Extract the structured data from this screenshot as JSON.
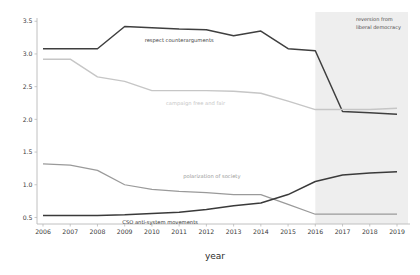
{
  "chart_data": {
    "type": "line",
    "title": "",
    "xlabel": "year",
    "ylabel": "",
    "categories": [
      2006,
      2007,
      2008,
      2009,
      2010,
      2011,
      2012,
      2013,
      2014,
      2015,
      2016,
      2017,
      2018,
      2019
    ],
    "xlim": [
      2006,
      2019
    ],
    "ylim": [
      0.4,
      3.55
    ],
    "grid": false,
    "legend_position": "inline-labels",
    "yticks": [
      "0.5",
      "1.0",
      "1.5",
      "2.0",
      "2.5",
      "3.0",
      "3.5"
    ],
    "ytick_values": [
      0.5,
      1.0,
      1.5,
      2.0,
      2.5,
      3.0,
      3.5
    ],
    "xticks": [
      "2006",
      "2007",
      "2008",
      "2009",
      "2010",
      "2011",
      "2012",
      "2013",
      "2014",
      "2015",
      "2016",
      "2017",
      "2018",
      "2019"
    ],
    "series": [
      {
        "name": "respect counterarguments",
        "color": "#3f3f3f",
        "width": 1.5,
        "label_x": 2011.0,
        "label_y": 3.18,
        "values": [
          3.08,
          3.08,
          3.08,
          3.42,
          3.4,
          3.38,
          3.37,
          3.28,
          3.35,
          3.08,
          3.05,
          2.12,
          2.1,
          2.08
        ]
      },
      {
        "name": "campaign free and fair",
        "color": "#c6c6c6",
        "width": 1.4,
        "label_x": 2011.6,
        "label_y": 2.22,
        "values": [
          2.92,
          2.92,
          2.65,
          2.58,
          2.44,
          2.44,
          2.44,
          2.43,
          2.4,
          2.28,
          2.15,
          2.15,
          2.15,
          2.17
        ]
      },
      {
        "name": "polarization of society",
        "color": "#9a9a9a",
        "width": 1.2,
        "label_x": 2012.2,
        "label_y": 1.1,
        "values": [
          1.32,
          1.3,
          1.22,
          1.0,
          0.93,
          0.9,
          0.88,
          0.85,
          0.85,
          0.7,
          0.55,
          0.55,
          0.55,
          0.55
        ]
      },
      {
        "name": "CSO anti-system movements",
        "color": "#3a3a3a",
        "width": 1.5,
        "label_x": 2010.3,
        "label_y": 0.4,
        "values": [
          0.53,
          0.53,
          0.53,
          0.54,
          0.56,
          0.58,
          0.62,
          0.68,
          0.72,
          0.85,
          1.05,
          1.15,
          1.18,
          1.2
        ]
      }
    ],
    "shaded_region": {
      "label_line1": "reversion from",
      "label_line2": "liberal democracy",
      "x_start": 2016,
      "x_end": 2019,
      "color": "#eeeeee"
    }
  }
}
